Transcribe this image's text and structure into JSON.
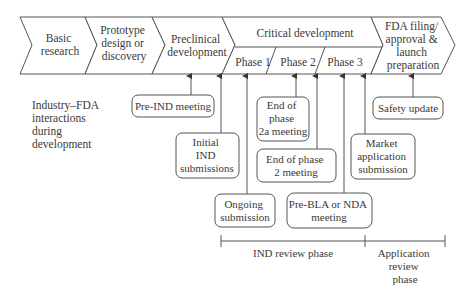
{
  "stages": [
    {
      "id": "basic",
      "lines": [
        "Basic",
        "research"
      ]
    },
    {
      "id": "prototype",
      "lines": [
        "Prototype",
        "design or",
        "discovery"
      ]
    },
    {
      "id": "preclinical",
      "lines": [
        "Preclinical",
        "development"
      ]
    },
    {
      "id": "critical",
      "lines": [
        "Critical development"
      ]
    },
    {
      "id": "fda",
      "lines": [
        "FDA filing/",
        "approval &",
        "launch",
        "preparation"
      ]
    }
  ],
  "phases": [
    "Phase 1",
    "Phase 2",
    "Phase 3"
  ],
  "side_label": [
    "Industry–FDA",
    "interactions",
    "during",
    "development"
  ],
  "interactions": [
    {
      "id": "pre-ind",
      "lines": [
        "Pre-IND meeting"
      ]
    },
    {
      "id": "initial-ind",
      "lines": [
        "Initial",
        "IND",
        "submissions"
      ]
    },
    {
      "id": "ongoing",
      "lines": [
        "Ongoing",
        "submission"
      ]
    },
    {
      "id": "eop2a",
      "lines": [
        "End of",
        "phase",
        "2a meeting"
      ]
    },
    {
      "id": "eop2",
      "lines": [
        "End of phase",
        "2 meeting"
      ]
    },
    {
      "id": "pre-bla",
      "lines": [
        "Pre-BLA or NDA",
        "meeting"
      ]
    },
    {
      "id": "market",
      "lines": [
        "Market",
        "application",
        "submission"
      ]
    },
    {
      "id": "safety",
      "lines": [
        "Safety update"
      ]
    }
  ],
  "timeline": {
    "ind_review": "IND review phase",
    "application_review": [
      "Application",
      "review",
      "phase"
    ]
  }
}
